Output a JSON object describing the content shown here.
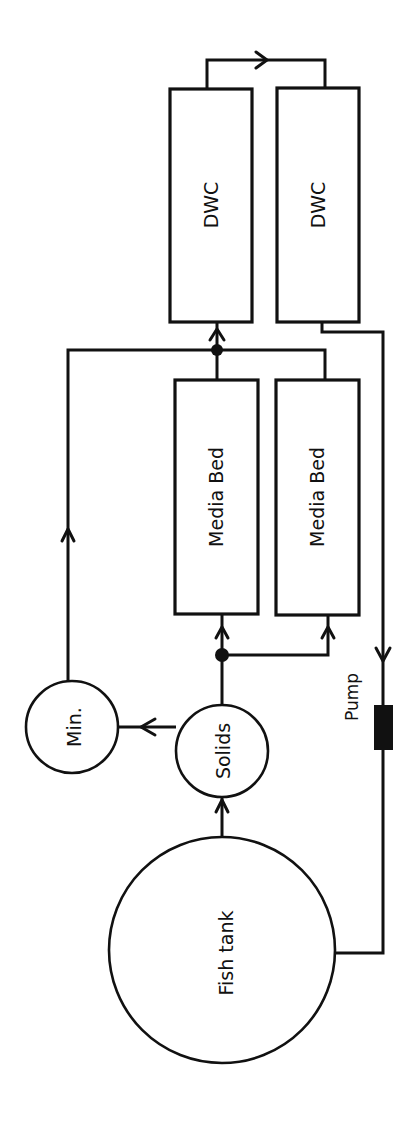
{
  "diagram": {
    "title": "",
    "orientation": "rotated -90deg (text reads bottom-to-top)",
    "colors": {
      "stroke": "#111111",
      "background": "#ffffff",
      "pump_fill": "#111111"
    },
    "nodes": {
      "fish_tank": {
        "label": "Fish tank",
        "shape": "circle"
      },
      "solids": {
        "label": "Solids",
        "shape": "circle"
      },
      "mineralization": {
        "label": "Min.",
        "shape": "circle"
      },
      "media_bed_1": {
        "label": "Media Bed",
        "shape": "rectangle"
      },
      "media_bed_2": {
        "label": "Media Bed",
        "shape": "rectangle"
      },
      "dwc_1": {
        "label": "DWC",
        "shape": "rectangle"
      },
      "dwc_2": {
        "label": "DWC",
        "shape": "rectangle"
      },
      "pump": {
        "label": "Pump",
        "shape": "filled-rectangle"
      }
    },
    "edges": [
      {
        "from": "Fish tank",
        "to": "Solids"
      },
      {
        "from": "Solids",
        "to": "Min."
      },
      {
        "from": "Solids",
        "to": "Media Bed (1)",
        "via": "junction"
      },
      {
        "from": "Solids",
        "to": "Media Bed (2)",
        "via": "junction"
      },
      {
        "from": "Min.",
        "to": "DWC (1)",
        "via": "junction"
      },
      {
        "from": "Media Bed (1)",
        "to": "DWC (1)",
        "via": "junction"
      },
      {
        "from": "Media Bed (2)",
        "to": "DWC (1)",
        "via": "junction"
      },
      {
        "from": "DWC (1)",
        "to": "DWC (2)"
      },
      {
        "from": "DWC (2)",
        "to": "Pump"
      },
      {
        "from": "Pump",
        "to": "Fish tank"
      }
    ]
  }
}
